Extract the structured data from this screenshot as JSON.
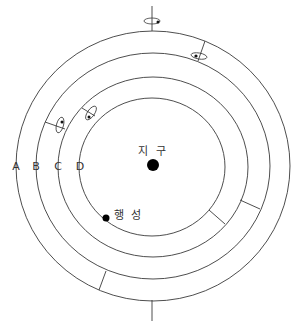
{
  "diagram": {
    "title": "",
    "center_label": "지 구",
    "planet_label": "행 성",
    "sphere_labels": [
      "A",
      "B",
      "C",
      "D"
    ],
    "colors": {
      "line": "#3a3a3a",
      "dot": "#000000",
      "background": "#ffffff"
    }
  }
}
